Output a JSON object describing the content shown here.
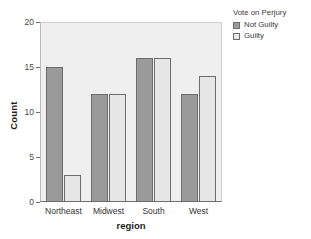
{
  "chart_data": {
    "type": "bar",
    "title": "",
    "xlabel": "region",
    "ylabel": "Count",
    "categories": [
      "Northeast",
      "Midwest",
      "South",
      "West"
    ],
    "series": [
      {
        "name": "Not Guilty",
        "color": "#9a9a9a",
        "values": [
          15,
          12,
          16,
          12
        ]
      },
      {
        "name": "Guilty",
        "color": "#e6e6e6",
        "values": [
          3,
          12,
          16,
          14
        ]
      }
    ],
    "ylim": [
      0,
      20
    ],
    "yticks": [
      "0",
      "5",
      "10",
      "15",
      "20"
    ],
    "ytick_values": [
      0,
      5,
      10,
      15,
      20
    ],
    "grid": false,
    "legend": {
      "title": "Vote on Perjury",
      "position": "right"
    },
    "plot_background": "#efefef",
    "page_background": "#ffffff"
  }
}
